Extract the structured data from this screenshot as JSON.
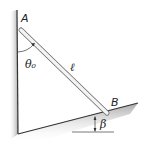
{
  "diagram": {
    "labels": {
      "point_a": "A",
      "point_b": "B",
      "angle_theta": "θ₀",
      "length": "ℓ",
      "angle_beta": "β"
    },
    "colors": {
      "shadow": "#b8b8b8",
      "wall_line": "#333333",
      "rod_fill": "#e6e6e6",
      "rod_edge": "#6a6a6a",
      "text": "#222222"
    }
  }
}
